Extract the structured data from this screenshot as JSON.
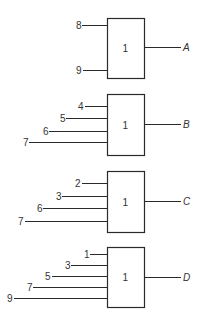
{
  "diagram": {
    "type": "logic-or-gates",
    "gates": [
      {
        "id": "A",
        "symbol": "1",
        "output": "A",
        "box": {
          "x": 107,
          "y": 18,
          "w": 37,
          "h": 60
        },
        "output_y": 47,
        "inputs": [
          {
            "label": "8",
            "y": 25,
            "label_x": 76,
            "line_x": 82
          },
          {
            "label": "9",
            "y": 70,
            "label_x": 76,
            "line_x": 83
          }
        ]
      },
      {
        "id": "B",
        "symbol": "1",
        "output": "B",
        "box": {
          "x": 107,
          "y": 94,
          "w": 37,
          "h": 61
        },
        "output_y": 124,
        "inputs": [
          {
            "label": "4",
            "y": 106,
            "label_x": 78,
            "line_x": 85
          },
          {
            "label": "5",
            "y": 118,
            "label_x": 60,
            "line_x": 66
          },
          {
            "label": "6",
            "y": 131,
            "label_x": 43,
            "line_x": 49
          },
          {
            "label": "7",
            "y": 142,
            "label_x": 23,
            "line_x": 29
          }
        ]
      },
      {
        "id": "C",
        "symbol": "1",
        "output": "C",
        "box": {
          "x": 107,
          "y": 171,
          "w": 37,
          "h": 61
        },
        "output_y": 201,
        "inputs": [
          {
            "label": "2",
            "y": 183,
            "label_x": 75,
            "line_x": 82
          },
          {
            "label": "3",
            "y": 196,
            "label_x": 56,
            "line_x": 62
          },
          {
            "label": "6",
            "y": 208,
            "label_x": 37,
            "line_x": 43
          },
          {
            "label": "7",
            "y": 221,
            "label_x": 18,
            "line_x": 25
          }
        ]
      },
      {
        "id": "D",
        "symbol": "1",
        "output": "D",
        "box": {
          "x": 107,
          "y": 247,
          "w": 37,
          "h": 60
        },
        "output_y": 277,
        "inputs": [
          {
            "label": "1",
            "y": 254,
            "label_x": 84,
            "line_x": 90
          },
          {
            "label": "3",
            "y": 265,
            "label_x": 65,
            "line_x": 71
          },
          {
            "label": "5",
            "y": 276,
            "label_x": 45,
            "line_x": 52
          },
          {
            "label": "7",
            "y": 287,
            "label_x": 27,
            "line_x": 33
          },
          {
            "label": "9",
            "y": 298,
            "label_x": 7,
            "line_x": 14
          }
        ]
      }
    ],
    "output_line_end_x": 181,
    "output_label_x": 183
  }
}
